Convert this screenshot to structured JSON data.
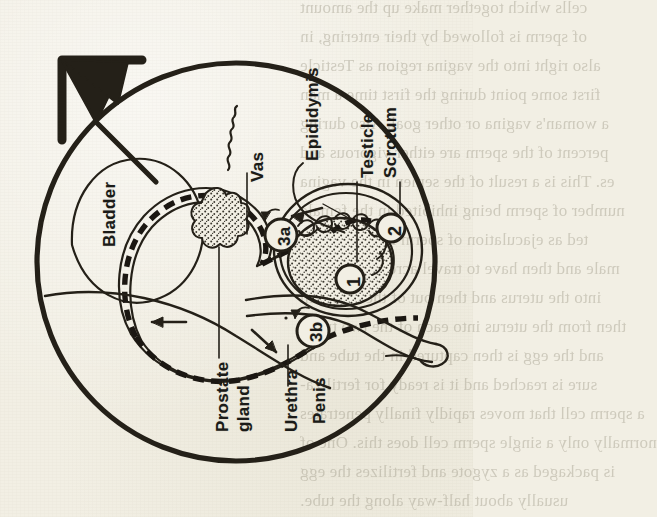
{
  "figure": {
    "name": "male-reproductive-system-diagram",
    "symbol": "mars-male-symbol",
    "background_color": "#f2efe4",
    "ink_color": "#1b1b18"
  },
  "labels": {
    "bladder": "Bladder",
    "vas": "Vas",
    "epididymis": "Epididymis",
    "testicle": "Testicle",
    "scrotum": "Scrotum",
    "prostate_gland_line1": "Prostate",
    "prostate_gland_line2": "gland",
    "urethra": "Urethra",
    "penis": "Penis"
  },
  "markers": [
    {
      "id": "marker-1",
      "text": "1"
    },
    {
      "id": "marker-2",
      "text": "2"
    },
    {
      "id": "marker-3a",
      "text": "3a"
    },
    {
      "id": "marker-3b",
      "text": "3b"
    }
  ],
  "bleed_through_text": [
    "cells which together make up the amount",
    "of sperm is followed by their entering, in",
    "also right into the vagina region as Testicle",
    "first some point during the first time a man",
    "a woman's vagina or other goal. Also during",
    "percent of the sperm are either vigorous and",
    "es. This is a result of the semen in the vagina",
    "number of sperm being inhibited in the female",
    "ted as ejaculation of sperm in the bladder",
    "male and then have to travel across the cervix",
    "into the uterus and then out of the uterus in",
    "then from the uterus into each of the two tubes",
    "and the egg is then captured in the tube and",
    "sure is reached and it is ready for fertiliza-",
    "a sperm cell that moves rapidly finally penetrates",
    "normally only a single sperm cell does this. One of",
    "is packaged as a zygote and fertilizes the egg",
    "usually about half-way along the tube.",
    "ple, find the rest of Figure 16 easy to follow"
  ]
}
